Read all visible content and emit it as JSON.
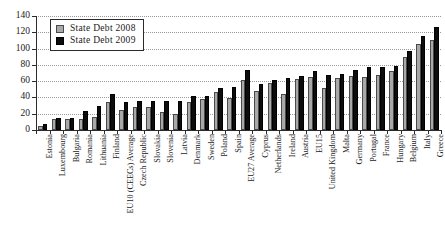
{
  "chart_data": {
    "type": "bar",
    "title": "",
    "subtitle": "",
    "xlabel": "",
    "ylabel": "",
    "ylim": [
      0,
      140
    ],
    "yticks": [
      0,
      20,
      40,
      60,
      80,
      100,
      120,
      140
    ],
    "grid": true,
    "legend_position": "top-left",
    "categories": [
      "Estonia",
      "Luxembourg",
      "Bulgaria",
      "Romania",
      "Lithuania",
      "Finland",
      "EU10 (CEECs) Average",
      "Czech Republic",
      "Slovakia",
      "Slovenia",
      "Latvia",
      "Denmark",
      "Sweden",
      "Poland",
      "Spain",
      "EU27 Average",
      "Cyprus",
      "Netherlands",
      "Ireland",
      "Austria",
      "EU15",
      "United Kingdom",
      "Malta",
      "Germany",
      "Portugal",
      "France",
      "Hungary",
      "Belgium",
      "Italy",
      "Greece"
    ],
    "series": [
      {
        "name": "State Debt 2008",
        "color": "#a9a9a9",
        "values": [
          4.6,
          13.5,
          13.7,
          13.3,
          15.6,
          34.1,
          24.0,
          28.2,
          27.7,
          21.9,
          19.5,
          34.2,
          38.0,
          47.1,
          39.7,
          61.6,
          48.4,
          58.2,
          44.1,
          62.5,
          64.6,
          52.0,
          63.7,
          66.0,
          65.3,
          67.5,
          72.9,
          89.8,
          105.8,
          110.3
        ]
      },
      {
        "name": "State Debt 2009",
        "color": "#0d0d0d",
        "values": [
          7.2,
          14.5,
          14.8,
          23.7,
          29.3,
          44.0,
          34.6,
          35.4,
          35.7,
          35.9,
          36.1,
          41.6,
          42.3,
          51.0,
          53.2,
          73.6,
          56.2,
          60.9,
          64.0,
          66.5,
          72.6,
          68.1,
          69.1,
          73.2,
          76.8,
          77.6,
          78.3,
          96.7,
          115.8,
          126.8
        ]
      }
    ]
  },
  "legend": {
    "items": [
      {
        "label": "State Debt 2008"
      },
      {
        "label": "State Debt 2009"
      }
    ]
  }
}
